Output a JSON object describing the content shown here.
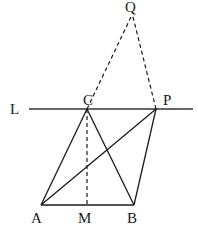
{
  "diagram": {
    "points": {
      "Q": {
        "label": "Q",
        "x": 132,
        "y": 13
      },
      "C": {
        "label": "C",
        "x": 87,
        "y": 109
      },
      "P": {
        "label": "P",
        "x": 156,
        "y": 109
      },
      "A": {
        "label": "A",
        "x": 41,
        "y": 205
      },
      "M": {
        "label": "M",
        "x": 87,
        "y": 205
      },
      "B": {
        "label": "B",
        "x": 134,
        "y": 205
      }
    },
    "line_label": "L",
    "labels": {
      "Q": "Q",
      "C": "C",
      "P": "P",
      "L": "L",
      "A": "A",
      "M": "M",
      "B": "B"
    },
    "segments": {
      "solid": [
        "L (line through C and P)",
        "AC",
        "CB",
        "AB",
        "AP",
        "BP"
      ],
      "dashed": [
        "CQ",
        "PQ",
        "CM"
      ]
    }
  }
}
